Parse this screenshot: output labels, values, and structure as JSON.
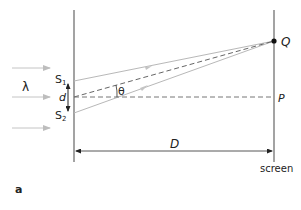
{
  "diagram": {
    "labels": {
      "wavelength": "λ",
      "slit1": "S",
      "slit1_sub": "1",
      "slit2": "S",
      "slit2_sub": "2",
      "slit_separation": "d",
      "angle": "θ",
      "point_q": "Q",
      "point_p": "P",
      "distance": "D",
      "screen": "screen",
      "panel": "a"
    },
    "colors": {
      "line": "#555555",
      "ray": "#b5b5b5",
      "arrow": "#bdbdbd",
      "dashed": "#666666",
      "dot": "#111111"
    }
  }
}
